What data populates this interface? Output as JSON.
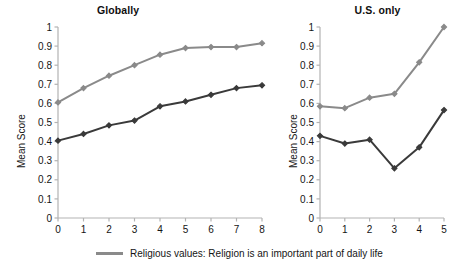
{
  "figure": {
    "background": "#ffffff",
    "panels": [
      {
        "id": "global",
        "title": "Globally",
        "ylabel": "Mean Score"
      },
      {
        "id": "us",
        "title": "U.S. only",
        "ylabel": "Mean Score"
      }
    ]
  },
  "legend": {
    "position": "bottom",
    "entries": [
      {
        "label": "Religious values: Religion is an important part of daily life",
        "color": "#8a8a8a",
        "marker": "line"
      }
    ]
  },
  "colors": {
    "series_gray": "#8a8a8a",
    "series_dark": "#3a3a3a",
    "axis": "#b3b3b3",
    "text": "#151515"
  },
  "chart_data": [
    {
      "type": "line",
      "title": "Globally",
      "xlabel": "",
      "ylabel": "Mean Score",
      "x": [
        0,
        1,
        2,
        3,
        4,
        5,
        6,
        7,
        8
      ],
      "xtick_labels": [
        "0",
        "1",
        "2",
        "3",
        "4",
        "5",
        "6",
        "7",
        "8"
      ],
      "ytick_labels": [
        "0",
        "0.1",
        "0.2",
        "0.3",
        "0.4",
        "0.5",
        "0.6",
        "0.7",
        "0.8",
        "0.9",
        "1"
      ],
      "xlim": [
        0,
        8
      ],
      "ylim": [
        0,
        1
      ],
      "grid": false,
      "legend_position": "below-figure",
      "series": [
        {
          "name": "Religious values: Religion is an important part of daily life",
          "color": "#8a8a8a",
          "values": [
            0.605,
            0.68,
            0.745,
            0.8,
            0.855,
            0.89,
            0.895,
            0.895,
            0.915
          ]
        },
        {
          "name": "Second series (dark)",
          "color": "#3a3a3a",
          "values": [
            0.405,
            0.44,
            0.485,
            0.51,
            0.585,
            0.61,
            0.645,
            0.68,
            0.695
          ]
        }
      ]
    },
    {
      "type": "line",
      "title": "U.S. only",
      "xlabel": "",
      "ylabel": "Mean Score",
      "x": [
        0,
        1,
        2,
        3,
        4,
        5
      ],
      "xtick_labels": [
        "0",
        "1",
        "2",
        "3",
        "4",
        "5"
      ],
      "ytick_labels": [
        "0",
        "0.1",
        "0.2",
        "0.3",
        "0.4",
        "0.5",
        "0.6",
        "0.7",
        "0.8",
        "0.9",
        "1"
      ],
      "xlim": [
        0,
        5
      ],
      "ylim": [
        0,
        1
      ],
      "grid": false,
      "legend_position": "below-figure",
      "series": [
        {
          "name": "Religious values: Religion is an important part of daily life",
          "color": "#8a8a8a",
          "values": [
            0.585,
            0.575,
            0.63,
            0.65,
            0.815,
            1.0
          ]
        },
        {
          "name": "Second series (dark)",
          "color": "#3a3a3a",
          "values": [
            0.43,
            0.39,
            0.41,
            0.26,
            0.37,
            0.565
          ]
        }
      ]
    }
  ]
}
